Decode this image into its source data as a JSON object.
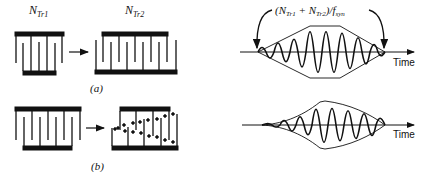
{
  "panel_a": {
    "label": "(a)",
    "left_transducer": {
      "label_main": "N",
      "label_sub": "Tr1",
      "fingers": 5
    },
    "right_transducer": {
      "label_main": "N",
      "label_sub": "Tr2",
      "fingers": 9
    }
  },
  "panel_b": {
    "label": "(b)"
  },
  "waveform_top": {
    "annotation_pre": "(N",
    "annotation_sub1": "Tr1",
    "annotation_mid": " + N",
    "annotation_sub2": "Tr2",
    "annotation_post": ")/f",
    "annotation_sub3": "syn",
    "axis_label": "Time"
  },
  "waveform_bottom": {
    "axis_label": "Time"
  }
}
